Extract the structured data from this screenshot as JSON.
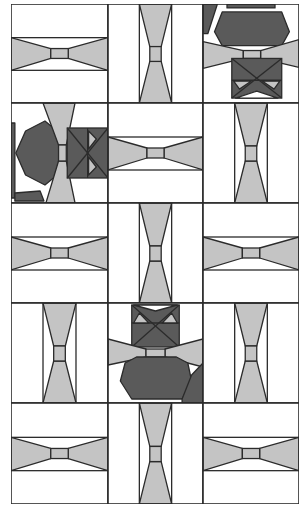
{
  "quilt": {
    "colors": {
      "background": "#ffffff",
      "line": "#2b2b2b",
      "light_gray": "#c4c4c4",
      "dark_gray": "#5a5a5a"
    },
    "grid": {
      "cols": 3,
      "rows": 5,
      "col_x": [
        0,
        97,
        192,
        288
      ],
      "row_y": [
        0,
        99,
        199,
        299,
        399,
        500
      ]
    },
    "blocks": [
      {
        "row": 0,
        "col": 0,
        "type": "bowtie-horizontal"
      },
      {
        "row": 0,
        "col": 1,
        "type": "bowtie-vertical"
      },
      {
        "row": 0,
        "col": 2,
        "type": "cat-upright"
      },
      {
        "row": 1,
        "col": 0,
        "type": "cat-sideways"
      },
      {
        "row": 1,
        "col": 1,
        "type": "bowtie-horizontal"
      },
      {
        "row": 1,
        "col": 2,
        "type": "bowtie-vertical"
      },
      {
        "row": 2,
        "col": 0,
        "type": "bowtie-horizontal"
      },
      {
        "row": 2,
        "col": 1,
        "type": "bowtie-vertical"
      },
      {
        "row": 2,
        "col": 2,
        "type": "bowtie-horizontal"
      },
      {
        "row": 3,
        "col": 0,
        "type": "bowtie-vertical"
      },
      {
        "row": 3,
        "col": 1,
        "type": "cat-inverted"
      },
      {
        "row": 3,
        "col": 2,
        "type": "bowtie-vertical"
      },
      {
        "row": 4,
        "col": 0,
        "type": "bowtie-horizontal"
      },
      {
        "row": 4,
        "col": 1,
        "type": "bowtie-vertical"
      },
      {
        "row": 4,
        "col": 2,
        "type": "bowtie-horizontal"
      }
    ]
  }
}
